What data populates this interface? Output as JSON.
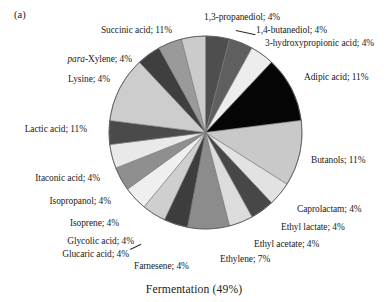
{
  "figure": {
    "panel_label": "(a)",
    "caption": "Fermentation (49%)"
  },
  "chart_data": {
    "type": "pie",
    "title": "Fermentation (49%)",
    "panel": "(a)",
    "xlabel": "",
    "ylabel": "",
    "legend_position": "outside-labels",
    "grid": false,
    "label_format": "name; value%",
    "total_percent": 100,
    "categories": [
      "1,3-propanediol",
      "1,4-butanediol",
      "3-hydroxypropionic acid",
      "Adipic acid",
      "Butanols",
      "Caprolactam",
      "Ethyl lactate",
      "Ethyl acetate",
      "Ethylene",
      "Farnesene",
      "Glucaric acid",
      "Glycolic acid",
      "Isoprene",
      "Isopropanol",
      "Itaconic acid",
      "Lactic acid",
      "Lysine",
      "para-Xylene",
      "Succinic acid"
    ],
    "values": [
      4,
      4,
      4,
      11,
      11,
      4,
      4,
      4,
      7,
      4,
      4,
      4,
      4,
      4,
      4,
      11,
      4,
      4,
      11
    ],
    "slices": [
      {
        "name": "1,3-propanediol",
        "label": "1,3-propanediol; 4%",
        "value": 4,
        "color": "#4e4e4e",
        "start_deg": 0,
        "end_deg": 14.4
      },
      {
        "name": "1,4-butanediol",
        "label": "1,4-butanediol; 4%",
        "value": 4,
        "color": "#5f5f5f",
        "start_deg": 14.4,
        "end_deg": 28.8
      },
      {
        "name": "3-hydroxypropionic acid",
        "label": "3-hydroxypropionic acid; 4%",
        "value": 4,
        "color": "#ededed",
        "start_deg": 28.8,
        "end_deg": 43.2
      },
      {
        "name": "Adipic acid",
        "label": "Adipic acid; 11%",
        "value": 11,
        "color": "#050505",
        "start_deg": 43.2,
        "end_deg": 82.8
      },
      {
        "name": "Butanols",
        "label": "Butanols; 11%",
        "value": 11,
        "color": "#c9c9c9",
        "start_deg": 82.8,
        "end_deg": 122.4
      },
      {
        "name": "Caprolactam",
        "label": "Caprolactam; 4%",
        "value": 4,
        "color": "#e2e2e2",
        "start_deg": 122.4,
        "end_deg": 136.8
      },
      {
        "name": "Ethyl lactate",
        "label": "Ethyl lactate; 4%",
        "value": 4,
        "color": "#474747",
        "start_deg": 136.8,
        "end_deg": 151.2
      },
      {
        "name": "Ethyl acetate",
        "label": "Ethyl acetate; 4%",
        "value": 4,
        "color": "#dcdcdc",
        "start_deg": 151.2,
        "end_deg": 165.6
      },
      {
        "name": "Ethylene",
        "label": "Ethylene; 7%",
        "value": 7,
        "color": "#8c8c8c",
        "start_deg": 165.6,
        "end_deg": 190.8
      },
      {
        "name": "Farnesene",
        "label": "Farnesene; 4%",
        "value": 4,
        "color": "#3d3d3d",
        "start_deg": 190.8,
        "end_deg": 205.2
      },
      {
        "name": "Glucaric acid",
        "label": "Glucaric acid; 4%",
        "value": 4,
        "color": "#cfcfcf",
        "start_deg": 205.2,
        "end_deg": 219.6
      },
      {
        "name": "Glycolic acid",
        "label": "Glycolic acid; 4%",
        "value": 4,
        "color": "#efefef",
        "start_deg": 219.6,
        "end_deg": 234.0
      },
      {
        "name": "Isoprene",
        "label": "Isoprene; 4%",
        "value": 4,
        "color": "#8f8f8f",
        "start_deg": 234.0,
        "end_deg": 248.4
      },
      {
        "name": "Isopropanol",
        "label": "Isopropanol; 4%",
        "value": 4,
        "color": "#e9e9e9",
        "start_deg": 248.4,
        "end_deg": 262.8
      },
      {
        "name": "Itaconic acid",
        "label": "Itaconic acid; 4%",
        "value": 4,
        "color": "#4a4a4a",
        "start_deg": 262.8,
        "end_deg": 277.2
      },
      {
        "name": "Lactic acid",
        "label": "Lactic acid; 11%",
        "value": 11,
        "color": "#cdcdcd",
        "start_deg": 277.2,
        "end_deg": 316.8
      },
      {
        "name": "Lysine",
        "label": "Lysine; 4%",
        "value": 4,
        "color": "#3f3f3f",
        "start_deg": 316.8,
        "end_deg": 331.2
      },
      {
        "name": "para-Xylene",
        "label": "-Xylene; 4%",
        "value": 4,
        "color": "#9a9a9a",
        "start_deg": 331.2,
        "end_deg": 345.6
      },
      {
        "name": "Succinic acid",
        "label": "Succinic acid; 11%",
        "value": 11,
        "color": "#cbcbcb",
        "start_deg": 345.6,
        "end_deg": 360.0
      }
    ]
  },
  "labels": {
    "propanediol": "1,3-propanediol; 4%",
    "butanediol": "1,4-butanediol; 4%",
    "hydroxypropionic": "3-hydroxypropionic acid; 4%",
    "adipic": "Adipic acid; 11%",
    "butanols": "Butanols; 11%",
    "caprolactam": "Caprolactam; 4%",
    "ethyl_lactate": "Ethyl lactate; 4%",
    "ethyl_acetate": "Ethyl acetate; 4%",
    "ethylene": "Ethylene; 7%",
    "farnesene": "Farnesene; 4%",
    "glucaric": "Glucaric acid; 4%",
    "glycolic": "Glycolic acid; 4%",
    "isoprene": "Isoprene; 4%",
    "isopropanol": "Isopropanol; 4%",
    "itaconic": "Itaconic acid; 4%",
    "lactic": "Lactic acid; 11%",
    "lysine": "Lysine; 4%",
    "para_xylene_italic": "para",
    "para_xylene_rest": "-Xylene; 4%",
    "succinic": "Succinic acid; 11%"
  }
}
